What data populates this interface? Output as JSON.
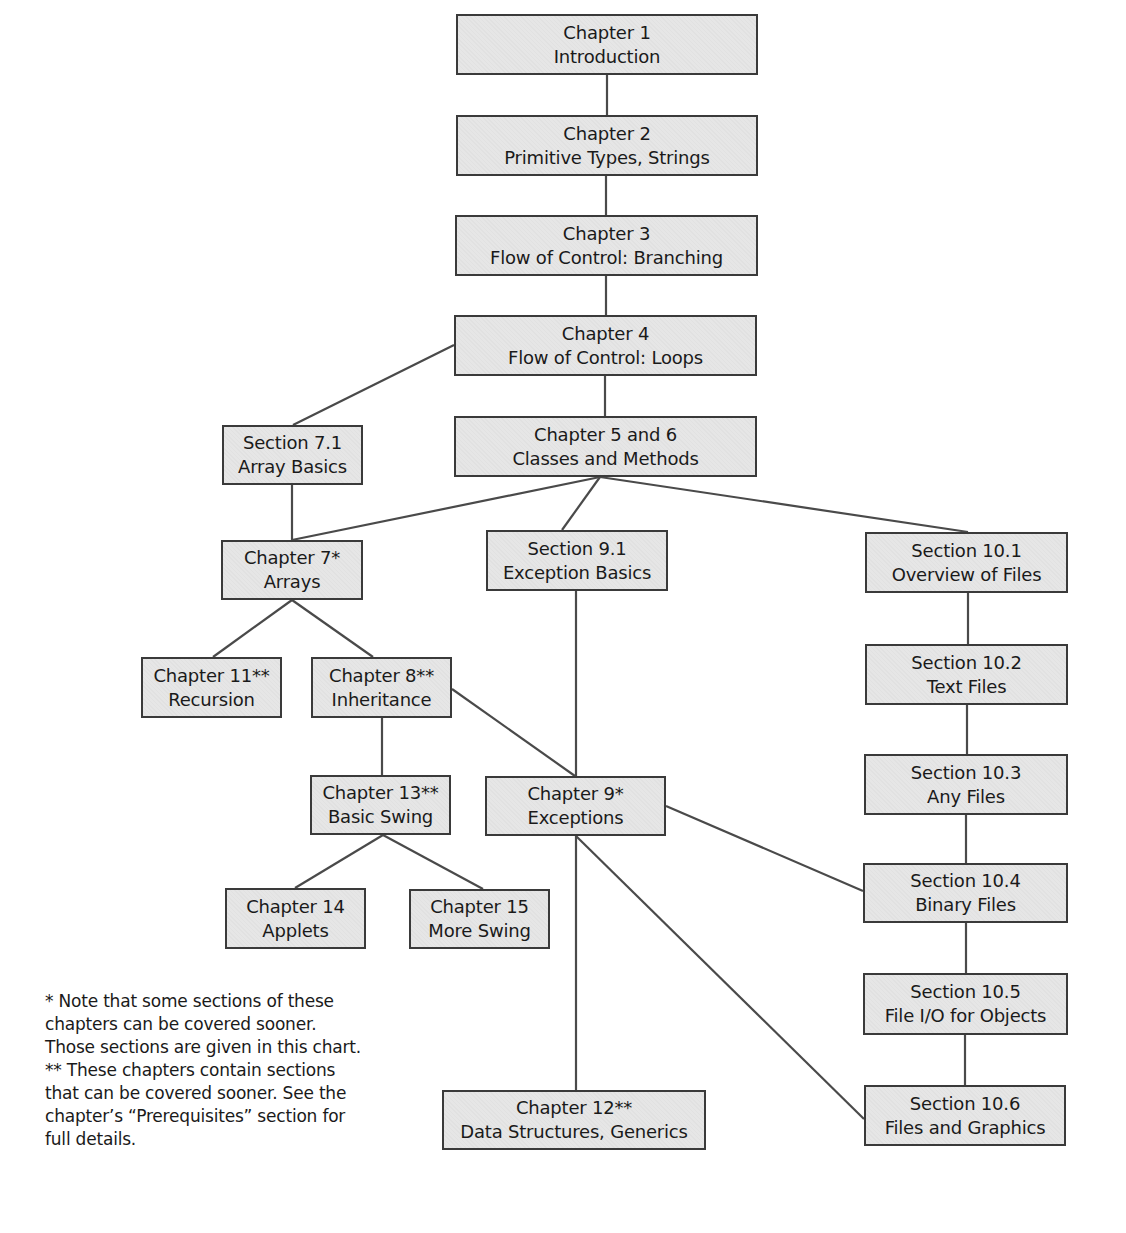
{
  "diagram": {
    "nodes": [
      {
        "id": "ch1",
        "line1": "Chapter 1",
        "line2": "Introduction",
        "x": 456,
        "y": 14,
        "w": 302,
        "h": 61
      },
      {
        "id": "ch2",
        "line1": "Chapter 2",
        "line2": "Primitive Types, Strings",
        "x": 456,
        "y": 115,
        "w": 302,
        "h": 61
      },
      {
        "id": "ch3",
        "line1": "Chapter 3",
        "line2": "Flow of Control: Branching",
        "x": 455,
        "y": 215,
        "w": 303,
        "h": 61
      },
      {
        "id": "ch4",
        "line1": "Chapter 4",
        "line2": "Flow of Control: Loops",
        "x": 454,
        "y": 315,
        "w": 303,
        "h": 61
      },
      {
        "id": "ch5_6",
        "line1": "Chapter 5 and 6",
        "line2": "Classes and Methods",
        "x": 454,
        "y": 416,
        "w": 303,
        "h": 61
      },
      {
        "id": "sec7_1",
        "line1": "Section 7.1",
        "line2": "Array Basics",
        "x": 222,
        "y": 425,
        "w": 141,
        "h": 60
      },
      {
        "id": "ch7",
        "line1": "Chapter 7*",
        "line2": "Arrays",
        "x": 221,
        "y": 540,
        "w": 142,
        "h": 60
      },
      {
        "id": "sec9_1",
        "line1": "Section 9.1",
        "line2": "Exception Basics",
        "x": 486,
        "y": 530,
        "w": 182,
        "h": 61
      },
      {
        "id": "sec10_1",
        "line1": "Section 10.1",
        "line2": "Overview of Files",
        "x": 865,
        "y": 532,
        "w": 203,
        "h": 61
      },
      {
        "id": "ch11",
        "line1": "Chapter 11**",
        "line2": "Recursion",
        "x": 141,
        "y": 657,
        "w": 141,
        "h": 61
      },
      {
        "id": "ch8",
        "line1": "Chapter 8**",
        "line2": "Inheritance",
        "x": 311,
        "y": 657,
        "w": 141,
        "h": 61
      },
      {
        "id": "sec10_2",
        "line1": "Section 10.2",
        "line2": "Text Files",
        "x": 865,
        "y": 644,
        "w": 203,
        "h": 61
      },
      {
        "id": "ch13",
        "line1": "Chapter 13**",
        "line2": "Basic Swing",
        "x": 310,
        "y": 775,
        "w": 141,
        "h": 60
      },
      {
        "id": "ch9",
        "line1": "Chapter 9*",
        "line2": "Exceptions",
        "x": 485,
        "y": 776,
        "w": 181,
        "h": 60
      },
      {
        "id": "sec10_3",
        "line1": "Section 10.3",
        "line2": "Any Files",
        "x": 864,
        "y": 754,
        "w": 204,
        "h": 61
      },
      {
        "id": "sec10_4",
        "line1": "Section 10.4",
        "line2": "Binary Files",
        "x": 863,
        "y": 863,
        "w": 205,
        "h": 60
      },
      {
        "id": "ch14",
        "line1": "Chapter 14",
        "line2": "Applets",
        "x": 225,
        "y": 888,
        "w": 141,
        "h": 61
      },
      {
        "id": "ch15",
        "line1": "Chapter 15",
        "line2": "More Swing",
        "x": 409,
        "y": 889,
        "w": 141,
        "h": 60
      },
      {
        "id": "sec10_5",
        "line1": "Section 10.5",
        "line2": "File I/O for Objects",
        "x": 863,
        "y": 973,
        "w": 205,
        "h": 62
      },
      {
        "id": "ch12",
        "line1": "Chapter 12**",
        "line2": "Data Structures, Generics",
        "x": 442,
        "y": 1090,
        "w": 264,
        "h": 60
      },
      {
        "id": "sec10_6",
        "line1": "Section 10.6",
        "line2": "Files and Graphics",
        "x": 864,
        "y": 1085,
        "w": 202,
        "h": 61
      }
    ],
    "edges": [
      {
        "from": "ch1",
        "to": "ch2",
        "x1": 607,
        "y1": 75,
        "x2": 607,
        "y2": 115
      },
      {
        "from": "ch2",
        "to": "ch3",
        "x1": 606,
        "y1": 176,
        "x2": 606,
        "y2": 215
      },
      {
        "from": "ch3",
        "to": "ch4",
        "x1": 606,
        "y1": 276,
        "x2": 606,
        "y2": 315
      },
      {
        "from": "ch4",
        "to": "ch5_6",
        "x1": 605,
        "y1": 376,
        "x2": 605,
        "y2": 416
      },
      {
        "from": "ch4",
        "to": "sec7_1",
        "x1": 454,
        "y1": 345,
        "x2": 293,
        "y2": 425
      },
      {
        "from": "sec7_1",
        "to": "ch7",
        "x1": 292,
        "y1": 485,
        "x2": 292,
        "y2": 540
      },
      {
        "from": "ch5_6",
        "to": "ch7",
        "x1": 600,
        "y1": 477,
        "x2": 292,
        "y2": 540
      },
      {
        "from": "ch5_6",
        "to": "sec9_1",
        "x1": 600,
        "y1": 477,
        "x2": 562,
        "y2": 530
      },
      {
        "from": "ch5_6",
        "to": "sec10_1",
        "x1": 600,
        "y1": 477,
        "x2": 968,
        "y2": 532
      },
      {
        "from": "ch7",
        "to": "ch11",
        "x1": 292,
        "y1": 600,
        "x2": 213,
        "y2": 657
      },
      {
        "from": "ch7",
        "to": "ch8",
        "x1": 292,
        "y1": 600,
        "x2": 373,
        "y2": 657
      },
      {
        "from": "ch8",
        "to": "ch13",
        "x1": 382,
        "y1": 718,
        "x2": 382,
        "y2": 775
      },
      {
        "from": "ch8",
        "to": "ch9",
        "x1": 452,
        "y1": 689,
        "x2": 575,
        "y2": 776
      },
      {
        "from": "sec9_1",
        "to": "ch9",
        "x1": 576,
        "y1": 591,
        "x2": 576,
        "y2": 776
      },
      {
        "from": "ch13",
        "to": "ch14",
        "x1": 383,
        "y1": 835,
        "x2": 295,
        "y2": 888
      },
      {
        "from": "ch13",
        "to": "ch15",
        "x1": 383,
        "y1": 835,
        "x2": 483,
        "y2": 889
      },
      {
        "from": "ch9",
        "to": "ch12",
        "x1": 576,
        "y1": 836,
        "x2": 576,
        "y2": 1090
      },
      {
        "from": "ch9",
        "to": "sec10_6",
        "x1": 576,
        "y1": 836,
        "x2": 864,
        "y2": 1119
      },
      {
        "from": "ch9",
        "to": "sec10_4",
        "x1": 666,
        "y1": 806,
        "x2": 863,
        "y2": 891
      },
      {
        "from": "sec10_1",
        "to": "sec10_2",
        "x1": 968,
        "y1": 593,
        "x2": 968,
        "y2": 644
      },
      {
        "from": "sec10_2",
        "to": "sec10_3",
        "x1": 967,
        "y1": 705,
        "x2": 967,
        "y2": 754
      },
      {
        "from": "sec10_3",
        "to": "sec10_4",
        "x1": 966,
        "y1": 815,
        "x2": 966,
        "y2": 863
      },
      {
        "from": "sec10_4",
        "to": "sec10_5",
        "x1": 966,
        "y1": 923,
        "x2": 966,
        "y2": 973
      },
      {
        "from": "sec10_5",
        "to": "sec10_6",
        "x1": 965,
        "y1": 1035,
        "x2": 965,
        "y2": 1085
      }
    ]
  },
  "footnote": {
    "lines": [
      "* Note that some sections of these",
      "chapters can be covered sooner.",
      "Those sections are given in this chart.",
      "** These chapters contain sections",
      "that can be covered sooner. See the",
      "chapter’s “Prerequisites” section for",
      "full details."
    ]
  },
  "colors": {
    "box_fill": "#e6e6e6",
    "box_border": "#3a3a3a",
    "line": "#4a4a4a",
    "text": "#1a1a1a"
  }
}
